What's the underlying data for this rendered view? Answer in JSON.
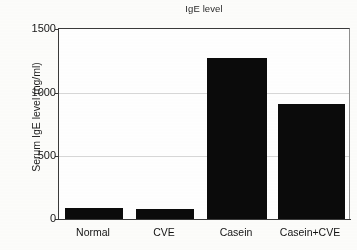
{
  "chart_data": {
    "type": "bar",
    "title": "IgE level",
    "xlabel": "",
    "ylabel": "Serum IgE level (ng/ml)",
    "categories": [
      "Normal",
      "CVE",
      "Casein",
      "Casein+CVE"
    ],
    "values": [
      86,
      80,
      1270,
      910
    ],
    "ylim": [
      0,
      1500
    ],
    "yticks": [
      0,
      500,
      1000,
      1500
    ],
    "ytick_labels": [
      "0",
      "500",
      "1000",
      "1500"
    ],
    "grid": "horizontal",
    "legend": "none",
    "series": [
      {
        "name": "Serum IgE level",
        "values": [
          86,
          80,
          1270,
          910
        ]
      }
    ],
    "bar_color": "#0b0b0b",
    "axis_color": "#3a3a3a",
    "gridline_color": "#d8d8d8",
    "background_color": "#ffffff"
  },
  "ticks": {
    "y0": "0",
    "y1": "500",
    "y2": "1000",
    "y3": "1500"
  },
  "categories": {
    "c0": "Normal",
    "c1": "CVE",
    "c2": "Casein",
    "c3": "Casein+CVE"
  }
}
